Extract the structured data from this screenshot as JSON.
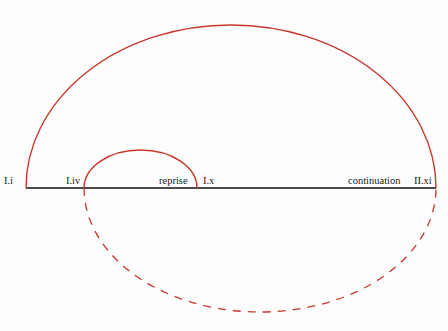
{
  "colors": {
    "arc": "#c8362b",
    "axis": "#111111",
    "text": "#222222"
  },
  "labels": {
    "i": "I.i",
    "iv": "I.iv",
    "reprise": "reprise",
    "x": "I.x",
    "continuation": "continuation",
    "xi": "II.xi"
  }
}
